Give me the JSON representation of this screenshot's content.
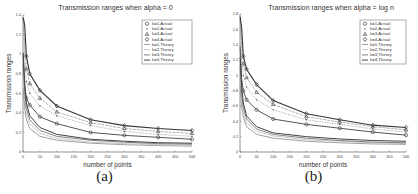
{
  "chart_data": [
    {
      "type": "line",
      "panel_label": "(a)",
      "title": "Transmission ranges when alpha = 0",
      "xlabel": "number of points",
      "ylabel": "Transmission ranges",
      "xlim": [
        0,
        500
      ],
      "ylim": [
        0,
        1.4
      ],
      "xticks": [
        0,
        50,
        100,
        150,
        200,
        250,
        300,
        350,
        400,
        450,
        500
      ],
      "yticks": [
        0,
        0.2,
        0.4,
        0.6,
        0.8,
        1,
        1.2,
        1.4
      ],
      "ytick_labels": [
        "0",
        "0.2",
        "0.4",
        "0.6",
        "0.8",
        "1",
        "1.2",
        "1.4"
      ],
      "grid": false,
      "legend_position": "upper right",
      "legend": [
        "k=1,Actual",
        "k=2,Actual",
        "k=3,Actual",
        "k=4,Actual",
        "k=1,Theory",
        "k=2,Theory",
        "k=3,Theory",
        "k=4,Theory"
      ],
      "x": [
        5,
        10,
        20,
        50,
        100,
        200,
        300,
        400,
        500
      ],
      "series": [
        {
          "name": "k=1,Actual",
          "marker": "o",
          "values": [
            0.68,
            0.55,
            0.48,
            0.36,
            0.29,
            0.2,
            0.17,
            0.15,
            0.13
          ]
        },
        {
          "name": "k=2,Actual",
          "marker": ".",
          "values": [
            0.95,
            0.72,
            0.6,
            0.47,
            0.37,
            0.27,
            0.21,
            0.18,
            0.16
          ]
        },
        {
          "name": "k=3,Actual",
          "marker": "^",
          "values": [
            1.1,
            0.85,
            0.7,
            0.55,
            0.41,
            0.3,
            0.24,
            0.21,
            0.19
          ]
        },
        {
          "name": "k=4,Actual",
          "marker": "d",
          "values": [
            1.3,
            0.98,
            0.8,
            0.63,
            0.47,
            0.33,
            0.27,
            0.24,
            0.22
          ]
        },
        {
          "name": "k=1,Theory",
          "marker": "",
          "values": [
            0.45,
            0.33,
            0.24,
            0.16,
            0.12,
            0.09,
            0.075,
            0.065,
            0.06
          ]
        },
        {
          "name": "k=2,Theory",
          "marker": "",
          "values": [
            0.55,
            0.4,
            0.29,
            0.19,
            0.14,
            0.1,
            0.085,
            0.075,
            0.07
          ]
        },
        {
          "name": "k=3,Theory",
          "marker": "",
          "values": [
            0.62,
            0.45,
            0.33,
            0.22,
            0.16,
            0.12,
            0.1,
            0.085,
            0.08
          ]
        },
        {
          "name": "k=4,Theory",
          "marker": "",
          "values": [
            0.7,
            0.5,
            0.37,
            0.25,
            0.18,
            0.13,
            0.11,
            0.095,
            0.09
          ]
        }
      ]
    },
    {
      "type": "line",
      "panel_label": "(b)",
      "title": "Transmission ranges when alpha = log n",
      "xlabel": "number of points",
      "ylabel": "Transmission ranges",
      "xlim": [
        0,
        500
      ],
      "ylim": [
        0,
        1.8
      ],
      "xticks": [
        0,
        50,
        100,
        150,
        200,
        250,
        300,
        350,
        400,
        450,
        500
      ],
      "yticks": [
        0,
        0.2,
        0.4,
        0.6,
        0.8,
        1,
        1.2,
        1.4,
        1.6,
        1.8
      ],
      "ytick_labels": [
        "0",
        "0.2",
        "0.4",
        "0.6",
        "0.8",
        "1",
        "1.2",
        "1.4",
        "1.6",
        "1.8"
      ],
      "grid": false,
      "legend_position": "upper right",
      "legend": [
        "k=1,Actual",
        "k=2,Actual",
        "k=3,Actual",
        "k=4,Actual",
        "k=1,Theory",
        "k=2,Theory",
        "k=3,Theory",
        "k=4,Theory"
      ],
      "x": [
        5,
        10,
        20,
        50,
        100,
        200,
        300,
        400,
        500
      ],
      "series": [
        {
          "name": "k=1,Actual",
          "marker": "o",
          "values": [
            0.95,
            0.8,
            0.68,
            0.55,
            0.43,
            0.36,
            0.31,
            0.26,
            0.22
          ]
        },
        {
          "name": "k=2,Actual",
          "marker": ".",
          "values": [
            1.2,
            1.0,
            0.85,
            0.68,
            0.55,
            0.42,
            0.36,
            0.3,
            0.26
          ]
        },
        {
          "name": "k=3,Actual",
          "marker": "^",
          "values": [
            1.4,
            1.15,
            0.97,
            0.78,
            0.62,
            0.46,
            0.39,
            0.33,
            0.29
          ]
        },
        {
          "name": "k=4,Actual",
          "marker": "d",
          "values": [
            1.62,
            1.25,
            1.08,
            0.88,
            0.67,
            0.5,
            0.42,
            0.35,
            0.32
          ]
        },
        {
          "name": "k=1,Theory",
          "marker": "",
          "values": [
            0.6,
            0.45,
            0.33,
            0.23,
            0.18,
            0.14,
            0.12,
            0.105,
            0.1
          ]
        },
        {
          "name": "k=2,Theory",
          "marker": "",
          "values": [
            0.7,
            0.52,
            0.38,
            0.27,
            0.21,
            0.16,
            0.14,
            0.12,
            0.11
          ]
        },
        {
          "name": "k=3,Theory",
          "marker": "",
          "values": [
            0.78,
            0.58,
            0.43,
            0.3,
            0.23,
            0.18,
            0.15,
            0.13,
            0.12
          ]
        },
        {
          "name": "k=4,Theory",
          "marker": "",
          "values": [
            0.85,
            0.64,
            0.47,
            0.33,
            0.25,
            0.2,
            0.17,
            0.15,
            0.14
          ]
        }
      ]
    }
  ]
}
